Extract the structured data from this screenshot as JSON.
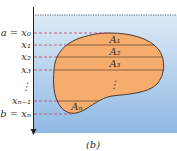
{
  "caption": "(b)",
  "colors": {
    "water_top": "#dceaf6",
    "water_bottom": "#8fb9e3",
    "blob_fill": "#f5ac6c",
    "blob_stroke": "#4a3a30",
    "dash_color": "#c2405e",
    "axis_color": "#222222"
  },
  "left_labels": [
    {
      "id": "a_x0",
      "text": "a = x₀"
    },
    {
      "id": "x1",
      "text": "x₁"
    },
    {
      "id": "x2",
      "text": "x₂"
    },
    {
      "id": "x3",
      "text": "x₃"
    },
    {
      "id": "vdots",
      "text": "⋮"
    },
    {
      "id": "xn_1",
      "text": "xₙ₋₁"
    },
    {
      "id": "b_xn",
      "text": "b = xₙ"
    }
  ],
  "area_labels": [
    {
      "id": "A1",
      "text": "A₁"
    },
    {
      "id": "A2",
      "text": "A₂"
    },
    {
      "id": "A3",
      "text": "A₃"
    },
    {
      "id": "dots",
      "text": "⋮"
    },
    {
      "id": "An",
      "text": "Aₙ"
    }
  ]
}
